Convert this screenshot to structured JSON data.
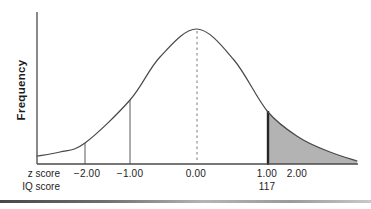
{
  "figure": {
    "ylabel": "Frequency",
    "axis_row_labels": {
      "z": "z score",
      "iq": "IQ score"
    }
  },
  "chart_data": {
    "type": "area",
    "ylabel": "Frequency",
    "x_axis_rows": [
      {
        "name": "z score",
        "ticks": [
          {
            "label": "−2.00",
            "z": -2
          },
          {
            "label": "−1.00",
            "z": -1
          },
          {
            "label": "0.00",
            "z": 0
          },
          {
            "label": "1.00",
            "z": 1
          },
          {
            "label": "2.00",
            "z": 2
          }
        ]
      },
      {
        "name": "IQ score",
        "ticks": [
          {
            "label": "117",
            "z": 1
          }
        ]
      }
    ],
    "shaded_region": {
      "from_z": 1,
      "to": "right tail end",
      "meaning": "proportion of scores at or above z = 1.00 (IQ 117)"
    },
    "reference_lines": [
      {
        "z": -2,
        "style": "thin",
        "px": 85,
        "y_top": 143,
        "y_bottom": 164
      },
      {
        "z": -1,
        "style": "thin",
        "px": 130,
        "y_top": 100,
        "y_bottom": 164
      },
      {
        "z": 0,
        "style": "dashed",
        "px": 197,
        "y_top": 31,
        "y_bottom": 163
      },
      {
        "z": 1,
        "style": "bold",
        "px": 268,
        "y_top": 111,
        "y_bottom": 165
      }
    ],
    "layout": {
      "grid": false,
      "legend": "none",
      "axis_color": "#4a4a4a",
      "curve_color": "#484848",
      "shade_color": "#b3b3b3",
      "bold_line_color": "#262626",
      "dashed_line_color": "#7a7a7a",
      "thin_line_color": "#5a5a5a",
      "plot": {
        "x_left": 37,
        "x_right": 358,
        "y_base": 164,
        "y_axis_top": 12
      },
      "curve_points": [
        [
          37,
          156
        ],
        [
          60,
          152
        ],
        [
          85,
          143
        ],
        [
          130,
          100
        ],
        [
          160,
          57
        ],
        [
          197,
          29
        ],
        [
          234,
          60
        ],
        [
          268,
          112
        ],
        [
          300,
          138
        ],
        [
          330,
          152
        ],
        [
          357,
          161
        ]
      ],
      "shade_start_index": 7,
      "z_tick_px": [
        {
          "label": "−2.00",
          "px": 87
        },
        {
          "label": "−1.00",
          "px": 130
        },
        {
          "label": "0.00",
          "px": 196
        },
        {
          "label": "1.00",
          "px": 267
        },
        {
          "label": "2.00",
          "px": 297
        }
      ],
      "iq_tick_px": [
        {
          "label": "117",
          "px": 267
        }
      ],
      "z_tick_row_top": 168,
      "iq_tick_row_top": 181
    }
  }
}
